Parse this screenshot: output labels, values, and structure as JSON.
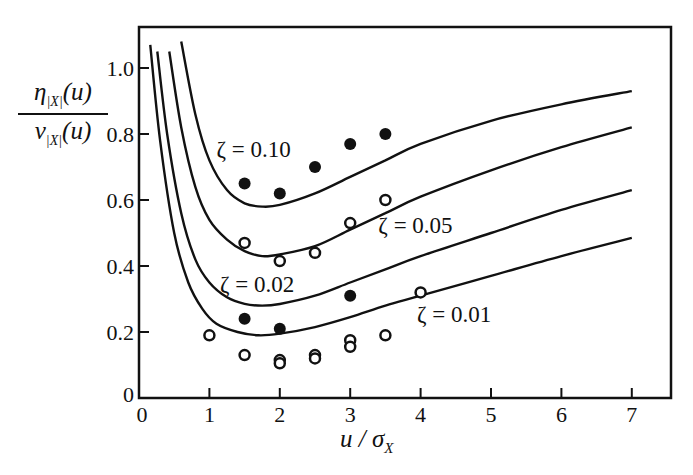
{
  "chart_data": {
    "type": "line",
    "title": "",
    "xlabel": "u / σ_X",
    "ylabel": "η_|X|(u) / ν_|X|(u)",
    "ylabel_parts": {
      "num_main": "η",
      "num_sub": "|X|",
      "num_arg": "(u)",
      "den_main": "ν",
      "den_sub": "|X|",
      "den_arg": "(u)"
    },
    "xlabel_parts": {
      "main": "u / σ",
      "sub": "X"
    },
    "xlim": [
      0,
      7.55
    ],
    "ylim": [
      0,
      1.1
    ],
    "x_ticks": [
      0,
      1,
      2,
      3,
      4,
      5,
      6,
      7
    ],
    "x_tick_labels": [
      "0",
      "1",
      "2",
      "3",
      "4",
      "5",
      "6",
      "7"
    ],
    "y_ticks": [
      0,
      0.2,
      0.4,
      0.6,
      0.8,
      1.0
    ],
    "y_tick_labels": [
      "0",
      "0.2",
      "0.4",
      "0.6",
      "0.8",
      "1.0"
    ],
    "grid": false,
    "legend": "none (curves labeled inline)",
    "series": [
      {
        "name": "ζ = 0.10",
        "label": "ζ = 0.10",
        "label_pos": [
          1.1,
          0.73
        ],
        "x": [
          0.6,
          0.8,
          1.0,
          1.25,
          1.5,
          1.75,
          2.0,
          2.5,
          3.0,
          3.5,
          4.0,
          5.0,
          6.0,
          7.0
        ],
        "values": [
          1.08,
          0.86,
          0.72,
          0.63,
          0.59,
          0.58,
          0.585,
          0.62,
          0.67,
          0.72,
          0.77,
          0.84,
          0.89,
          0.93
        ]
      },
      {
        "name": "ζ = 0.05",
        "label": "ζ = 0.05",
        "label_pos": [
          3.4,
          0.5
        ],
        "x": [
          0.43,
          0.6,
          0.8,
          1.0,
          1.25,
          1.5,
          1.75,
          2.0,
          2.5,
          3.0,
          3.5,
          4.0,
          5.0,
          6.0,
          7.0
        ],
        "values": [
          1.05,
          0.82,
          0.64,
          0.54,
          0.48,
          0.445,
          0.43,
          0.435,
          0.46,
          0.51,
          0.56,
          0.61,
          0.69,
          0.76,
          0.82
        ]
      },
      {
        "name": "ζ = 0.02",
        "label": "ζ = 0.02",
        "label_pos": [
          1.15,
          0.32
        ],
        "x": [
          0.26,
          0.4,
          0.6,
          0.8,
          1.0,
          1.25,
          1.5,
          1.75,
          2.0,
          2.5,
          3.0,
          3.5,
          4.0,
          5.0,
          6.0,
          7.0
        ],
        "values": [
          1.05,
          0.8,
          0.56,
          0.42,
          0.35,
          0.305,
          0.285,
          0.28,
          0.285,
          0.31,
          0.35,
          0.39,
          0.43,
          0.5,
          0.57,
          0.63
        ]
      },
      {
        "name": "ζ = 0.01",
        "label": "ζ = 0.01",
        "label_pos": [
          3.95,
          0.23
        ],
        "x": [
          0.16,
          0.3,
          0.5,
          0.7,
          0.9,
          1.1,
          1.4,
          1.7,
          2.0,
          2.5,
          3.0,
          3.5,
          4.0,
          5.0,
          6.0,
          7.0
        ],
        "values": [
          1.07,
          0.78,
          0.5,
          0.35,
          0.27,
          0.225,
          0.2,
          0.19,
          0.195,
          0.215,
          0.245,
          0.28,
          0.31,
          0.37,
          0.43,
          0.485
        ]
      }
    ],
    "scatter": [
      {
        "name": "filled markers",
        "marker": "filled-circle",
        "points": [
          [
            1.5,
            0.65
          ],
          [
            2.0,
            0.62
          ],
          [
            2.5,
            0.7
          ],
          [
            3.0,
            0.77
          ],
          [
            3.5,
            0.8
          ],
          [
            1.5,
            0.24
          ],
          [
            2.0,
            0.21
          ],
          [
            3.0,
            0.31
          ]
        ]
      },
      {
        "name": "open markers",
        "marker": "open-circle",
        "points": [
          [
            1.5,
            0.47
          ],
          [
            2.0,
            0.415
          ],
          [
            2.5,
            0.44
          ],
          [
            3.0,
            0.53
          ],
          [
            3.5,
            0.6
          ],
          [
            1.0,
            0.19
          ],
          [
            1.5,
            0.13
          ],
          [
            2.0,
            0.115
          ],
          [
            2.0,
            0.105
          ],
          [
            2.5,
            0.13
          ],
          [
            2.5,
            0.12
          ],
          [
            3.0,
            0.175
          ],
          [
            3.0,
            0.155
          ],
          [
            3.5,
            0.19
          ],
          [
            4.0,
            0.32
          ]
        ]
      }
    ],
    "colors": {
      "line": "#111111",
      "background": "#ffffff"
    }
  }
}
